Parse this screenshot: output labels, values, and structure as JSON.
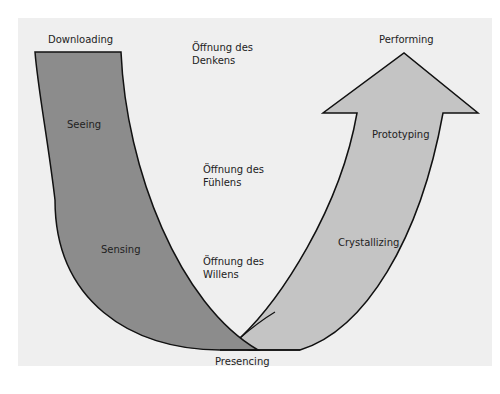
{
  "diagram": {
    "type": "Theory U",
    "colors": {
      "background": "#ffffff",
      "panel": "#efefef",
      "left_band": "#8c8c8c",
      "right_arrow": "#c4c4c4",
      "stroke": "#111111"
    },
    "labels": {
      "downloading": "Downloading",
      "seeing": "Seeing",
      "sensing": "Sensing",
      "presencing": "Presencing",
      "crystallizing": "Crystallizing",
      "prototyping": "Prototyping",
      "performing": "Performing"
    },
    "openings": [
      {
        "line1": "Öffnung des",
        "line2": "Denkens"
      },
      {
        "line1": "Öffnung des",
        "line2": "Fühlens"
      },
      {
        "line1": "Öffnung des",
        "line2": "Willens"
      }
    ]
  }
}
